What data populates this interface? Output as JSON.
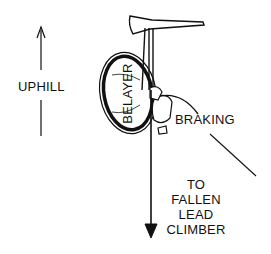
{
  "diagram": {
    "labels": {
      "uphill": "UPHILL",
      "belayer": "BELAYER",
      "braking": "BRAKING",
      "fallen_line1": "TO",
      "fallen_line2": "FALLEN",
      "fallen_line3": "LEAD",
      "fallen_line4": "CLIMBER"
    },
    "colors": {
      "ink": "#111111",
      "background": "#ffffff"
    }
  }
}
